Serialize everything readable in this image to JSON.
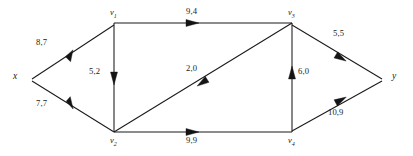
{
  "diagram": {
    "type": "directed-flow-network",
    "nodes": [
      {
        "id": "x",
        "label": "x",
        "sub": "",
        "x": 22,
        "y": 78
      },
      {
        "id": "v1",
        "label": "v",
        "sub": "1",
        "x": 113,
        "y": 22
      },
      {
        "id": "v3",
        "label": "v",
        "sub": "3",
        "x": 291,
        "y": 22
      },
      {
        "id": "v2",
        "label": "v",
        "sub": "2",
        "x": 113,
        "y": 133
      },
      {
        "id": "v4",
        "label": "v",
        "sub": "4",
        "x": 291,
        "y": 133
      },
      {
        "id": "y",
        "label": "y",
        "sub": "",
        "x": 389,
        "y": 78
      }
    ],
    "edges": [
      {
        "id": "x-v1",
        "from": "x",
        "to": "v1",
        "label": "8,7",
        "label_x": 49,
        "label_y": 43
      },
      {
        "id": "x-v2",
        "from": "x",
        "to": "v2",
        "label": "7,7",
        "label_x": 49,
        "label_y": 104
      },
      {
        "id": "v1-v3",
        "from": "v1",
        "to": "v3",
        "label": "9,4",
        "label_x": 191,
        "label_y": 11
      },
      {
        "id": "v1-v2",
        "from": "v1",
        "to": "v2",
        "label": "5,2",
        "label_x": 94,
        "label_y": 72
      },
      {
        "id": "v2-v3",
        "from": "v2",
        "to": "v3",
        "label": "2,0",
        "label_x": 191,
        "label_y": 68
      },
      {
        "id": "v2-v4",
        "from": "v2",
        "to": "v4",
        "label": "9,9",
        "label_x": 191,
        "label_y": 136
      },
      {
        "id": "v4-v3",
        "from": "v4",
        "to": "v3",
        "label": "6,0",
        "label_x": 300,
        "label_y": 72
      },
      {
        "id": "v3-y",
        "from": "v3",
        "to": "y",
        "label": "5,5",
        "label_x": 335,
        "label_y": 34
      },
      {
        "id": "v4-y",
        "from": "v4",
        "to": "y",
        "label": "10,9",
        "label_x": 330,
        "label_y": 113
      }
    ],
    "legend": {
      "label_format": "capacity,flow"
    },
    "colors": {
      "stroke": "#1a1a1a",
      "background": "#ffffff",
      "text": "#1a1a1a"
    }
  }
}
